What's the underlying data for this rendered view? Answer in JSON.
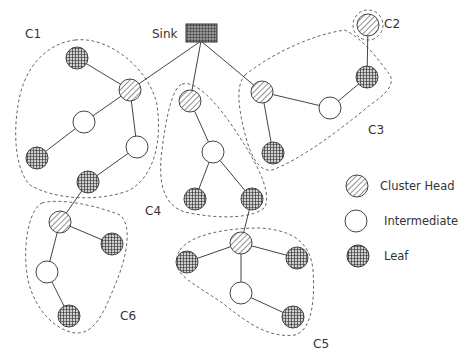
{
  "diagram": {
    "sink": {
      "label": "Sink",
      "x": 201,
      "y": 33
    },
    "clusters": [
      {
        "id": "C1",
        "label": "C1",
        "lx": 25,
        "ly": 38
      },
      {
        "id": "C2",
        "label": "C2",
        "lx": 384,
        "ly": 28
      },
      {
        "id": "C3",
        "label": "C3",
        "lx": 368,
        "ly": 134
      },
      {
        "id": "C4",
        "label": "C4",
        "lx": 145,
        "ly": 215
      },
      {
        "id": "C5",
        "label": "C5",
        "lx": 315,
        "ly": 348
      },
      {
        "id": "C6",
        "label": "C6",
        "lx": 120,
        "ly": 320
      }
    ],
    "nodes": [
      {
        "id": "c1_ch",
        "type": "cluster_head",
        "x": 130,
        "y": 90
      },
      {
        "id": "c1_l1",
        "type": "leaf",
        "x": 77,
        "y": 58
      },
      {
        "id": "c1_i1",
        "type": "intermediate",
        "x": 84,
        "y": 122
      },
      {
        "id": "c1_l2",
        "type": "leaf",
        "x": 37,
        "y": 158
      },
      {
        "id": "c1_i2",
        "type": "intermediate",
        "x": 137,
        "y": 147
      },
      {
        "id": "c1_l3",
        "type": "leaf",
        "x": 88,
        "y": 182
      },
      {
        "id": "c2_ch",
        "type": "cluster_head",
        "x": 368,
        "y": 25
      },
      {
        "id": "c3_ch",
        "type": "cluster_head",
        "x": 262,
        "y": 92
      },
      {
        "id": "c3_i1",
        "type": "intermediate",
        "x": 330,
        "y": 108
      },
      {
        "id": "c3_l1",
        "type": "leaf",
        "x": 367,
        "y": 77
      },
      {
        "id": "c3_l2",
        "type": "leaf",
        "x": 273,
        "y": 153
      },
      {
        "id": "c4_ch",
        "type": "cluster_head",
        "x": 190,
        "y": 101
      },
      {
        "id": "c4_i1",
        "type": "intermediate",
        "x": 213,
        "y": 152
      },
      {
        "id": "c4_l1",
        "type": "leaf",
        "x": 195,
        "y": 199
      },
      {
        "id": "c4_l2",
        "type": "leaf",
        "x": 252,
        "y": 199
      },
      {
        "id": "c5_ch",
        "type": "cluster_head",
        "x": 241,
        "y": 243
      },
      {
        "id": "c5_l1",
        "type": "leaf",
        "x": 187,
        "y": 262
      },
      {
        "id": "c5_l2",
        "type": "leaf",
        "x": 297,
        "y": 258
      },
      {
        "id": "c5_i1",
        "type": "intermediate",
        "x": 241,
        "y": 293
      },
      {
        "id": "c5_l3",
        "type": "leaf",
        "x": 293,
        "y": 317
      },
      {
        "id": "c6_ch",
        "type": "cluster_head",
        "x": 60,
        "y": 222
      },
      {
        "id": "c6_l1",
        "type": "leaf",
        "x": 112,
        "y": 244
      },
      {
        "id": "c6_i1",
        "type": "intermediate",
        "x": 47,
        "y": 272
      },
      {
        "id": "c6_l2",
        "type": "leaf",
        "x": 69,
        "y": 316
      }
    ],
    "edges": [
      [
        "sink",
        "c1_ch"
      ],
      [
        "sink",
        "c4_ch"
      ],
      [
        "sink",
        "c3_ch"
      ],
      [
        "c1_ch",
        "c1_l1"
      ],
      [
        "c1_ch",
        "c1_i1"
      ],
      [
        "c1_i1",
        "c1_l2"
      ],
      [
        "c1_ch",
        "c1_i2"
      ],
      [
        "c1_i2",
        "c1_l3"
      ],
      [
        "c1_l3",
        "c6_ch"
      ],
      [
        "c6_ch",
        "c6_l1"
      ],
      [
        "c6_ch",
        "c6_i1"
      ],
      [
        "c6_i1",
        "c6_l2"
      ],
      [
        "c2_ch",
        "c3_l1"
      ],
      [
        "c3_l1",
        "c3_i1"
      ],
      [
        "c3_i1",
        "c3_ch"
      ],
      [
        "c3_ch",
        "c3_l2"
      ],
      [
        "c4_ch",
        "c4_i1"
      ],
      [
        "c4_i1",
        "c4_l1"
      ],
      [
        "c4_i1",
        "c4_l2"
      ],
      [
        "c4_l2",
        "c5_ch"
      ],
      [
        "c5_ch",
        "c5_l1"
      ],
      [
        "c5_ch",
        "c5_l2"
      ],
      [
        "c5_ch",
        "c5_i1"
      ],
      [
        "c5_i1",
        "c5_l3"
      ]
    ]
  },
  "legend": {
    "items": [
      {
        "type": "cluster_head",
        "label": "Cluster Head"
      },
      {
        "type": "intermediate",
        "label": "Intermediate"
      },
      {
        "type": "leaf",
        "label": "Leaf"
      }
    ]
  }
}
